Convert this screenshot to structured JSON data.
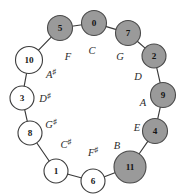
{
  "figure": {
    "name": "pitch-class-circle-of-fifths",
    "center": {
      "x": 92,
      "y": 100
    },
    "radius": 73,
    "colors": {
      "filled_node_fill": "#9a9a9a",
      "filled_node_stroke": "#4a4a4a",
      "open_node_fill": "#ffffff",
      "open_node_stroke": "#3d3d3d",
      "edge": "#3a3a3a",
      "text": "#1a1a1a",
      "background": "#ffffff"
    }
  },
  "nodes": [
    {
      "id": "node-0",
      "label": "0",
      "x": 94,
      "y": 23,
      "r": 12.5,
      "filled": true
    },
    {
      "id": "node-7",
      "label": "7",
      "x": 128,
      "y": 33,
      "r": 12.5,
      "filled": true
    },
    {
      "id": "node-2",
      "label": "2",
      "x": 154,
      "y": 56,
      "r": 12.0,
      "filled": true
    },
    {
      "id": "node-9",
      "label": "9",
      "x": 163,
      "y": 95,
      "r": 12.5,
      "filled": true
    },
    {
      "id": "node-4",
      "label": "4",
      "x": 155,
      "y": 131,
      "r": 12.5,
      "filled": true
    },
    {
      "id": "node-11",
      "label": "11",
      "x": 130,
      "y": 167,
      "r": 16.0,
      "filled": true
    },
    {
      "id": "node-6",
      "label": "6",
      "x": 93,
      "y": 181,
      "r": 12.0,
      "filled": false
    },
    {
      "id": "node-1",
      "label": "1",
      "x": 56,
      "y": 171,
      "r": 12.0,
      "filled": false
    },
    {
      "id": "node-8",
      "label": "8",
      "x": 30,
      "y": 133,
      "r": 12.0,
      "filled": false
    },
    {
      "id": "node-3",
      "label": "3",
      "x": 22,
      "y": 98,
      "r": 12.0,
      "filled": false
    },
    {
      "id": "node-10",
      "label": "10",
      "x": 29,
      "y": 60,
      "r": 13.5,
      "filled": false
    },
    {
      "id": "node-5",
      "label": "5",
      "x": 60,
      "y": 28,
      "r": 12.5,
      "filled": true
    }
  ],
  "edges": [
    {
      "from": 0,
      "to": 1
    },
    {
      "from": 1,
      "to": 2
    },
    {
      "from": 2,
      "to": 3
    },
    {
      "from": 3,
      "to": 4
    },
    {
      "from": 4,
      "to": 5
    },
    {
      "from": 5,
      "to": 6
    },
    {
      "from": 6,
      "to": 7
    },
    {
      "from": 7,
      "to": 8
    },
    {
      "from": 8,
      "to": 9
    },
    {
      "from": 9,
      "to": 10
    },
    {
      "from": 10,
      "to": 11
    },
    {
      "from": 11,
      "to": 0
    }
  ],
  "note_labels": [
    {
      "id": "note-C",
      "base": "C",
      "accidental": "",
      "x": 92,
      "y": 50
    },
    {
      "id": "note-G",
      "base": "G",
      "accidental": "",
      "x": 120,
      "y": 56
    },
    {
      "id": "note-D",
      "base": "D",
      "accidental": "",
      "x": 138,
      "y": 76
    },
    {
      "id": "note-A",
      "base": "A",
      "accidental": "",
      "x": 143,
      "y": 102
    },
    {
      "id": "note-E",
      "base": "E",
      "accidental": "",
      "x": 137,
      "y": 127
    },
    {
      "id": "note-B",
      "base": "B",
      "accidental": "",
      "x": 117,
      "y": 145
    },
    {
      "id": "note-Fsharp",
      "base": "F",
      "accidental": "♯",
      "x": 93,
      "y": 152
    },
    {
      "id": "note-Csharp",
      "base": "C",
      "accidental": "♯",
      "x": 66,
      "y": 144
    },
    {
      "id": "note-Gsharp",
      "base": "G",
      "accidental": "♯",
      "x": 51,
      "y": 124
    },
    {
      "id": "note-Dsharp",
      "base": "D",
      "accidental": "♯",
      "x": 45,
      "y": 98
    },
    {
      "id": "note-Asharp",
      "base": "A",
      "accidental": "♯",
      "x": 51,
      "y": 74
    },
    {
      "id": "note-F",
      "base": "F",
      "accidental": "",
      "x": 68,
      "y": 56
    }
  ]
}
